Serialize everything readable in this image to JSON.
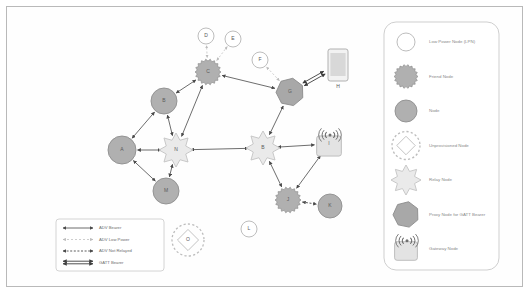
{
  "figure": {
    "kind": "bluetooth-mesh-network-topology",
    "frame_border_color": "#b9b9b9",
    "background_color": "#ffffff"
  },
  "palette": {
    "node_fill": "#b0b0b0",
    "node_stroke": "#8f8f8f",
    "lpn_fill": "#ffffff",
    "lpn_stroke": "#b5b5b5",
    "relay_fill": "#eaeaea",
    "relay_stroke": "#c3c3c3",
    "proxy_fill": "#a8a8a8",
    "proxy_stroke": "#8b8b8b",
    "gateway_fill": "#e3e3e3",
    "gateway_stroke": "#b8b8b8",
    "unprovisioned_stroke": "#bdbdbd",
    "phone_fill": "#d8d8d8",
    "phone_stroke": "#a9a9a9",
    "edge_color": "#5c5c5c",
    "edge_light_color": "#c8c8c8",
    "legend_panel_stroke": "#cfcfcf",
    "text_color": "#5a5a5a",
    "legend_text_color": "#8a8a8a"
  },
  "nodes": [
    {
      "id": "A",
      "label": "A",
      "type": "node",
      "x": 122,
      "y": 150,
      "r": 14
    },
    {
      "id": "B",
      "label": "B",
      "type": "node",
      "x": 164,
      "y": 101,
      "r": 13
    },
    {
      "id": "C",
      "label": "C",
      "type": "friend",
      "x": 208,
      "y": 72,
      "r": 13
    },
    {
      "id": "D",
      "label": "D",
      "type": "lpn",
      "x": 206,
      "y": 36,
      "r": 8
    },
    {
      "id": "E",
      "label": "E",
      "type": "lpn",
      "x": 233,
      "y": 39,
      "r": 8
    },
    {
      "id": "F",
      "label": "F",
      "type": "lpn",
      "x": 260,
      "y": 60,
      "r": 8
    },
    {
      "id": "N",
      "label": "N",
      "type": "relay",
      "x": 176,
      "y": 150,
      "r": 17
    },
    {
      "id": "M",
      "label": "M",
      "type": "node",
      "x": 166,
      "y": 191,
      "r": 13
    },
    {
      "id": "G",
      "label": "G",
      "type": "proxy",
      "x": 290,
      "y": 92,
      "r": 14
    },
    {
      "id": "H",
      "label": "H",
      "type": "phone",
      "x": 338,
      "y": 65,
      "r": 0
    },
    {
      "id": "B2",
      "label": "B",
      "type": "relay",
      "x": 263,
      "y": 148,
      "r": 17
    },
    {
      "id": "I",
      "label": "I",
      "type": "gateway",
      "x": 329,
      "y": 144,
      "r": 13
    },
    {
      "id": "J",
      "label": "J",
      "type": "friend",
      "x": 288,
      "y": 200,
      "r": 13
    },
    {
      "id": "K",
      "label": "K",
      "type": "node",
      "x": 330,
      "y": 206,
      "r": 12
    },
    {
      "id": "L",
      "label": "L",
      "type": "lpn",
      "x": 249,
      "y": 229,
      "r": 8
    },
    {
      "id": "O",
      "label": "O",
      "type": "unprovisioned",
      "x": 188,
      "y": 240,
      "r": 16
    }
  ],
  "edges": [
    {
      "from": "A",
      "to": "B",
      "style": "adv"
    },
    {
      "from": "B",
      "to": "C",
      "style": "adv"
    },
    {
      "from": "B",
      "to": "N",
      "style": "adv"
    },
    {
      "from": "A",
      "to": "N",
      "style": "adv"
    },
    {
      "from": "A",
      "to": "M",
      "style": "adv"
    },
    {
      "from": "M",
      "to": "N",
      "style": "adv"
    },
    {
      "from": "C",
      "to": "N",
      "style": "adv"
    },
    {
      "from": "C",
      "to": "G",
      "style": "adv"
    },
    {
      "from": "C",
      "to": "D",
      "style": "adv-low-power"
    },
    {
      "from": "C",
      "to": "E",
      "style": "adv-low-power"
    },
    {
      "from": "G",
      "to": "F",
      "style": "adv-low-power"
    },
    {
      "from": "G",
      "to": "B2",
      "style": "adv"
    },
    {
      "from": "G",
      "to": "H",
      "style": "gatt"
    },
    {
      "from": "N",
      "to": "B2",
      "style": "adv"
    },
    {
      "from": "B2",
      "to": "I",
      "style": "adv"
    },
    {
      "from": "B2",
      "to": "J",
      "style": "adv"
    },
    {
      "from": "I",
      "to": "J",
      "style": "adv"
    },
    {
      "from": "J",
      "to": "K",
      "style": "adv-not-relayed"
    }
  ],
  "arrow_legend": {
    "panel_name": "bearer-legend",
    "items": [
      {
        "label": "ADV Bearer",
        "style": "adv"
      },
      {
        "label": "ADV Low Power",
        "style": "adv-low-power"
      },
      {
        "label": "ADV Not Relayed",
        "style": "adv-not-relayed"
      },
      {
        "label": "GATT Bearer",
        "style": "gatt"
      }
    ]
  },
  "node_legend": {
    "panel_name": "node-type-legend",
    "items": [
      {
        "label": "Low Power Node (LPN)",
        "type": "lpn"
      },
      {
        "label": "Friend Node",
        "type": "friend"
      },
      {
        "label": "Node",
        "type": "node"
      },
      {
        "label": "Unprovisioned Node",
        "type": "unprovisioned"
      },
      {
        "label": "Relay Node",
        "type": "relay"
      },
      {
        "label": "Proxy Node for GATT Bearer",
        "type": "proxy"
      },
      {
        "label": "Gateway Node",
        "type": "gateway"
      }
    ]
  }
}
